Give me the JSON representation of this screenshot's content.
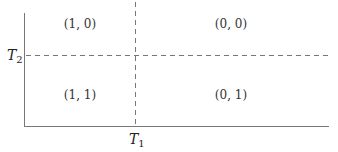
{
  "diagram": {
    "axes": {
      "x_threshold_label": "T",
      "x_threshold_sub": "1",
      "y_threshold_label": "T",
      "y_threshold_sub": "2"
    },
    "regions": [
      {
        "position": "top-left",
        "label": "(1, 0)"
      },
      {
        "position": "top-right",
        "label": "(0, 0)"
      },
      {
        "position": "bottom-left",
        "label": "(1, 1)"
      },
      {
        "position": "bottom-right",
        "label": "(0, 1)"
      }
    ],
    "colors": {
      "axis": "#666666",
      "dashed": "#777777",
      "text": "#333333"
    }
  }
}
